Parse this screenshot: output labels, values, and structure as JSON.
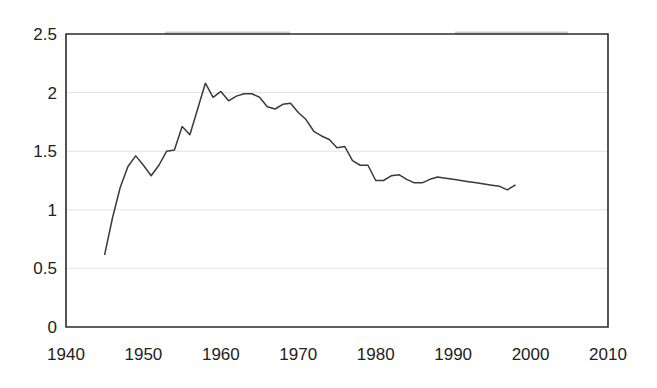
{
  "chart_data": {
    "type": "line",
    "title": "",
    "subtitle": "",
    "xlabel": "",
    "ylabel": "",
    "xlim": [
      1940,
      2010
    ],
    "ylim": [
      0,
      2.5
    ],
    "grid": true,
    "legend": false,
    "legend_position": "none",
    "x_ticks": [
      "1940",
      "1950",
      "1960",
      "1970",
      "1980",
      "1990",
      "2000",
      "2010"
    ],
    "x_tick_values": [
      1940,
      1950,
      1960,
      1970,
      1980,
      1990,
      2000,
      2010
    ],
    "y_ticks": [
      "0",
      "0.5",
      "1",
      "1.5",
      "2",
      "2.5"
    ],
    "y_tick_values": [
      0,
      0.5,
      1,
      1.5,
      2,
      2.5
    ],
    "series": [
      {
        "name": "series-1",
        "color": "#3a3a3a",
        "x": [
          1945,
          1946,
          1947,
          1948,
          1949,
          1950,
          1951,
          1952,
          1953,
          1954,
          1955,
          1956,
          1957,
          1958,
          1959,
          1960,
          1961,
          1962,
          1963,
          1964,
          1965,
          1966,
          1967,
          1968,
          1969,
          1970,
          1971,
          1972,
          1973,
          1974,
          1975,
          1976,
          1977,
          1978,
          1979,
          1980,
          1981,
          1982,
          1983,
          1984,
          1985,
          1986,
          1987,
          1988,
          1989,
          1990,
          1991,
          1992,
          1993,
          1994,
          1995,
          1996,
          1997,
          1998
        ],
        "values": [
          0.62,
          0.93,
          1.19,
          1.37,
          1.46,
          1.38,
          1.29,
          1.38,
          1.5,
          1.51,
          1.71,
          1.64,
          1.86,
          2.08,
          1.96,
          2.01,
          1.93,
          1.97,
          1.99,
          1.99,
          1.96,
          1.88,
          1.86,
          1.9,
          1.91,
          1.83,
          1.77,
          1.67,
          1.63,
          1.6,
          1.53,
          1.54,
          1.42,
          1.38,
          1.38,
          1.25,
          1.25,
          1.29,
          1.3,
          1.26,
          1.23,
          1.23,
          1.26,
          1.28,
          1.27,
          1.26,
          1.25,
          1.24,
          1.23,
          1.22,
          1.21,
          1.2,
          1.17,
          1.21
        ]
      }
    ]
  },
  "style": {
    "axis_color": "#2b2b2b",
    "grid_color": "#e2e2e2",
    "line_color": "#3a3a3a",
    "background": "#ffffff",
    "tick_text_color": "#222222"
  }
}
